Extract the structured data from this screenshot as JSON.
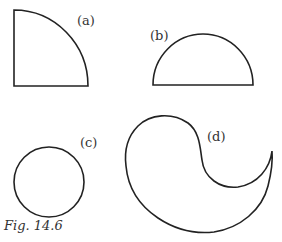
{
  "figure": {
    "caption": "Fig. 14.6",
    "stroke_color": "#222222",
    "shapes": [
      {
        "id": "a",
        "label": "(a)",
        "kind": "quarter-circle"
      },
      {
        "id": "b",
        "label": "(b)",
        "kind": "semicircle"
      },
      {
        "id": "c",
        "label": "(c)",
        "kind": "circle"
      },
      {
        "id": "d",
        "label": "(d)",
        "kind": "curved-teardrop (circle minus semicircle crescent)"
      }
    ]
  }
}
